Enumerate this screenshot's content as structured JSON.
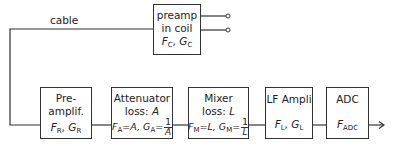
{
  "diagram": {
    "type": "block-diagram",
    "wire_label": "cable",
    "blocks": [
      {
        "id": "preamp-coil",
        "lines": [
          "preamp",
          "in coil"
        ],
        "params": {
          "F": "F",
          "F_sub": "C",
          "G": "G",
          "G_sub": "C"
        }
      },
      {
        "id": "preamplifier",
        "lines": [
          "Pre-",
          "amplif."
        ],
        "params": {
          "F": "F",
          "F_sub": "R",
          "G": "G",
          "G_sub": "R"
        }
      },
      {
        "id": "attenuator",
        "lines": [
          "Attenuator",
          "loss: "
        ],
        "loss_symbol": "A",
        "params": {
          "F": "F",
          "F_sub": "A",
          "F_eq": "=A, ",
          "G": "G",
          "G_sub": "A",
          "G_eq": "=",
          "num": "1",
          "den": "A"
        }
      },
      {
        "id": "mixer",
        "lines": [
          "Mixer",
          "loss: "
        ],
        "loss_symbol": "L",
        "params": {
          "F": "F",
          "F_sub": "M",
          "F_eq": "=L, ",
          "G": "G",
          "G_sub": "M",
          "G_eq": "=",
          "num": "1",
          "den": "L"
        }
      },
      {
        "id": "lf-ampli",
        "lines": [
          "LF Ampli"
        ],
        "params": {
          "F": "F",
          "F_sub": "L",
          "G": "G",
          "G_sub": "L"
        }
      },
      {
        "id": "adc",
        "lines": [
          "ADC"
        ],
        "params": {
          "F": "F",
          "F_sub": "ADC"
        }
      }
    ],
    "connections": [
      [
        "preamp-coil",
        "preamplifier"
      ],
      [
        "preamplifier",
        "attenuator"
      ],
      [
        "attenuator",
        "mixer"
      ],
      [
        "mixer",
        "lf-ampli"
      ],
      [
        "lf-ampli",
        "adc"
      ],
      [
        "adc",
        "output"
      ]
    ],
    "colors": {
      "line": "#333333",
      "background": "#ffffff"
    }
  }
}
